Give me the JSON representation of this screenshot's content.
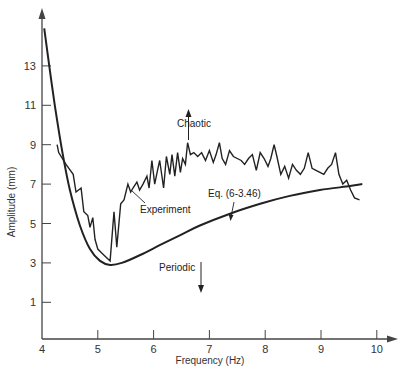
{
  "chart_data": {
    "type": "line",
    "title": "",
    "xlabel": "Frequency (Hz)",
    "ylabel": "Amplitude (mm)",
    "xlim": [
      4,
      10.2
    ],
    "ylim": [
      -0.85,
      15.5
    ],
    "grid": false,
    "legend": "none (curves labeled inline)",
    "x_ticks": [
      "4",
      "5",
      "6",
      "7",
      "8",
      "9",
      "10"
    ],
    "y_ticks": [
      "1",
      "3",
      "5",
      "7",
      "9",
      "11",
      "13"
    ],
    "series": [
      {
        "name": "Eq. (6-3.46)",
        "style": "smooth solid, thick",
        "x": [
          4.04,
          4.14,
          4.23,
          4.36,
          4.5,
          4.68,
          4.86,
          5.04,
          5.22,
          5.43,
          5.76,
          6.11,
          6.47,
          6.83,
          7.37,
          7.91,
          8.44,
          8.98,
          9.52,
          9.74
        ],
        "y": [
          14.9,
          12.8,
          11.0,
          8.7,
          6.7,
          4.9,
          3.7,
          3.1,
          2.9,
          3.0,
          3.4,
          3.9,
          4.4,
          4.9,
          5.5,
          6.0,
          6.4,
          6.7,
          6.9,
          6.1
        ]
      },
      {
        "name": "Experiment",
        "style": "jagged solid",
        "x": [
          4.3,
          4.43,
          4.56,
          4.61,
          4.7,
          4.75,
          4.82,
          4.86,
          4.91,
          4.95,
          5.0,
          5.07,
          5.22,
          5.29,
          5.34,
          5.41,
          5.47,
          5.54,
          5.59,
          5.63,
          5.7,
          5.75,
          5.81,
          5.88,
          5.92,
          5.97,
          6.02,
          6.07,
          6.11,
          6.18,
          6.23,
          6.29,
          6.33,
          6.38,
          6.43,
          6.48,
          6.52,
          6.57,
          6.61,
          6.66,
          6.72,
          6.79,
          6.86,
          6.93,
          7.0,
          7.07,
          7.12,
          7.18,
          7.23,
          7.29,
          7.36,
          7.43,
          7.5,
          7.57,
          7.63,
          7.7,
          7.77,
          7.84,
          7.91,
          7.98,
          8.05,
          8.1,
          8.16,
          8.21,
          8.28,
          8.35,
          8.42,
          8.49,
          8.56,
          8.63,
          8.7,
          8.77,
          8.84,
          8.91,
          8.98,
          9.05,
          9.12,
          9.19,
          9.26,
          9.32,
          9.39,
          9.46,
          9.53,
          9.6,
          9.69
        ],
        "y": [
          8.6,
          8.0,
          7.5,
          6.6,
          6.8,
          5.6,
          5.4,
          4.8,
          5.3,
          4.2,
          3.7,
          3.5,
          3.1,
          5.6,
          3.8,
          6.0,
          6.2,
          7.0,
          6.6,
          6.8,
          7.1,
          6.7,
          7.0,
          7.4,
          6.8,
          8.2,
          7.0,
          7.7,
          8.2,
          6.8,
          8.4,
          7.5,
          8.5,
          7.4,
          8.6,
          7.6,
          8.3,
          8.0,
          9.1,
          8.5,
          8.6,
          8.4,
          8.6,
          8.2,
          8.7,
          8.1,
          8.5,
          9.1,
          8.3,
          8.0,
          8.7,
          8.4,
          8.3,
          8.2,
          8.0,
          8.3,
          8.5,
          7.7,
          8.6,
          8.3,
          7.9,
          8.3,
          9.0,
          8.4,
          7.5,
          7.9,
          7.3,
          8.0,
          7.7,
          7.5,
          7.8,
          8.6,
          7.8,
          7.7,
          7.6,
          7.5,
          7.8,
          8.0,
          8.6,
          7.5,
          7.0,
          7.2,
          6.7,
          6.3,
          6.2
        ]
      }
    ],
    "annotations": [
      {
        "text": "Chaotic",
        "arrow": "up",
        "x": 6.85,
        "y": 9.7
      },
      {
        "text": "Periodic",
        "arrow": "down",
        "x": 6.85,
        "y": 2.6
      },
      {
        "text": "Experiment",
        "pointer_to": "Experiment curve near f=5.8"
      },
      {
        "text": "Eq. (6-3.46)",
        "pointer_to": "theory curve near f=7.35"
      }
    ]
  },
  "labels": {
    "xlabel": "Frequency (Hz)",
    "ylabel": "Amplitude (mm)",
    "chaotic": "Chaotic",
    "periodic": "Periodic",
    "experiment": "Experiment",
    "equation": "Eq. (6-3.46)"
  },
  "colors": {
    "line": "#222222",
    "axis": "#444444",
    "text": "#333333",
    "background": "#ffffff"
  }
}
